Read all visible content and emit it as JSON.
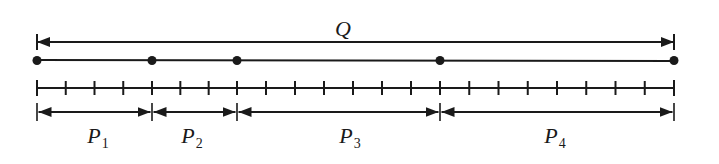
{
  "diagram": {
    "type": "segmented line partition",
    "total": {
      "label": "Q",
      "x_start": 37,
      "x_end": 674
    },
    "points_x": [
      37,
      152,
      237,
      440,
      674
    ],
    "tick_divisions": 22,
    "segments": [
      {
        "label": "P",
        "subscript": "1",
        "ticks": 4,
        "x_start": 37,
        "x_end": 152
      },
      {
        "label": "P",
        "subscript": "2",
        "ticks": 3,
        "x_start": 152,
        "x_end": 237
      },
      {
        "label": "P",
        "subscript": "3",
        "ticks": 7,
        "x_start": 237,
        "x_end": 440
      },
      {
        "label": "P",
        "subscript": "4",
        "ticks": 8,
        "x_start": 440,
        "x_end": 674
      }
    ],
    "colors": {
      "stroke": "#1a1a1a",
      "background": "#ffffff"
    }
  }
}
